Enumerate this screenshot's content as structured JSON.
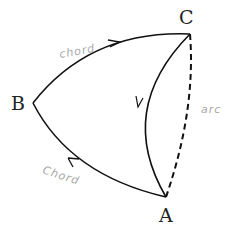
{
  "diagram": {
    "vertices": [
      {
        "id": "A",
        "label": "A",
        "x": 166,
        "y": 197
      },
      {
        "id": "B",
        "label": "B",
        "x": 33,
        "y": 103
      },
      {
        "id": "C",
        "label": "C",
        "x": 190,
        "y": 34
      }
    ],
    "edges": [
      {
        "from": "B",
        "to": "C",
        "style": "solid",
        "arrow": true,
        "label": "chord"
      },
      {
        "from": "A",
        "to": "B",
        "style": "solid",
        "arrow": true,
        "label": "Chord"
      },
      {
        "from": "C",
        "to": "A",
        "style": "solid",
        "arrow": true,
        "label": ""
      },
      {
        "from": "C",
        "to": "A",
        "style": "dashed",
        "arrow": false,
        "label": "arc"
      }
    ],
    "colors": {
      "line": "#111111",
      "label_text": "#222222",
      "annotation_text": "#a8a8a8",
      "background": "#ffffff"
    }
  },
  "labels": {
    "A": "A",
    "B": "B",
    "C": "C",
    "chord_top": "chord",
    "chord_bottom": "Chord",
    "arc": "arc"
  }
}
